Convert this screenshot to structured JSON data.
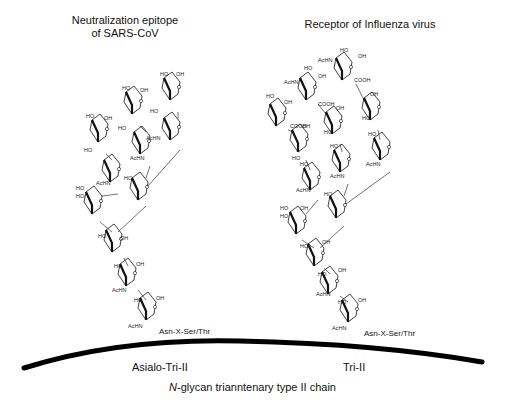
{
  "titles": {
    "left_line1": "Neutralization epitope",
    "left_line2": "of SARS-CoV",
    "right": "Receptor of Influenza virus"
  },
  "labels": {
    "left_glycan": "Asialo-Tri-II",
    "right_glycan": "Tri-II",
    "anchor_left": "Asn-X-Ser/Thr",
    "anchor_right": "Asn-X-Ser/Thr",
    "caption_italic": "N",
    "caption_rest": "-glycan trianntenary type II chain"
  },
  "groups": {
    "hydroxyl": "HO",
    "hydroxyl_r": "OH",
    "acetamido": "AcHN",
    "carboxyl": "COOH",
    "oxygen": "O"
  },
  "colors": {
    "ink": "#111111",
    "membrane": "#000000",
    "background": "#ffffff"
  }
}
